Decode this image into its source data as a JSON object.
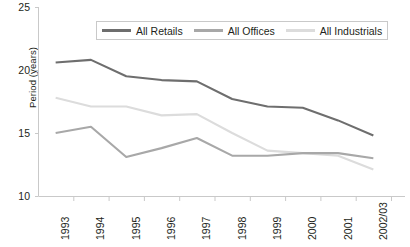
{
  "chart_data": {
    "type": "line",
    "title": "",
    "xlabel": "",
    "ylabel": "Period (years)",
    "categories": [
      "1993",
      "1994",
      "1995",
      "1996",
      "1997",
      "1998",
      "1999",
      "2000",
      "2001",
      "2002/03"
    ],
    "ylim": [
      10,
      25
    ],
    "yticks": [
      10,
      15,
      20,
      25
    ],
    "grid": false,
    "legend_position": "top-center",
    "series": [
      {
        "name": "All Retails",
        "color": "#6e6e6e",
        "values": [
          20.6,
          20.8,
          19.5,
          19.2,
          19.1,
          17.7,
          17.1,
          17.0,
          16.0,
          14.8
        ]
      },
      {
        "name": "All Offices",
        "color": "#a8a8a8",
        "values": [
          15.0,
          15.5,
          13.1,
          13.8,
          14.6,
          13.2,
          13.2,
          13.4,
          13.4,
          13.0
        ]
      },
      {
        "name": "All Industrials",
        "color": "#dcdcdc",
        "values": [
          17.8,
          17.1,
          17.1,
          16.4,
          16.5,
          15.0,
          13.6,
          13.4,
          13.2,
          12.1
        ]
      }
    ]
  },
  "axes": {
    "axis_color": "#c9c9c9",
    "tick_color": "#c9c9c9",
    "y_tick_labels": [
      "25",
      "20",
      "15",
      "10"
    ],
    "x_tick_labels": [
      "1993",
      "1994",
      "1995",
      "1996",
      "1997",
      "1998",
      "1999",
      "2000",
      "2001",
      "2002/03"
    ],
    "y_axis_title": "Period (years)"
  },
  "legend": {
    "items": [
      {
        "label": "All Retails",
        "color": "#6e6e6e"
      },
      {
        "label": "All Offices",
        "color": "#a8a8a8"
      },
      {
        "label": "All Industrials",
        "color": "#dcdcdc"
      }
    ]
  }
}
